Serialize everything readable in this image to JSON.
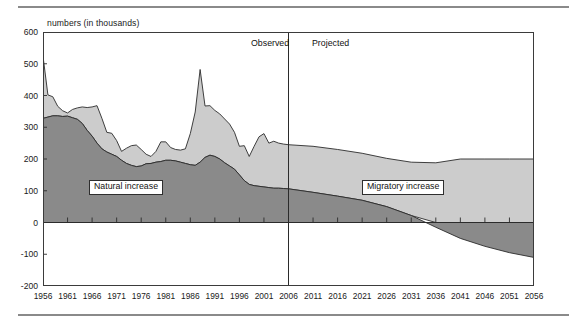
{
  "figure": {
    "y_axis_title": "numbers (in thousands)",
    "divider": {
      "observed_label": "Observed",
      "projected_label": "Projected",
      "divider_year": 2006
    },
    "series_labels": {
      "natural": "Natural increase",
      "migratory": "Migratory increase"
    },
    "colors": {
      "natural": "#8a8a8a",
      "migratory": "#cccccc",
      "axis": "#3b3b3b",
      "outline": "#2b2b2b",
      "rule": "#8a8a8a"
    }
  },
  "chart_data": {
    "type": "area",
    "title": "",
    "subtitle": "",
    "xlabel": "",
    "ylabel": "numbers (in thousands)",
    "stacked": true,
    "grid": false,
    "legend_position": "inline-annotation",
    "xlim": [
      1956,
      2056
    ],
    "ylim": [
      -200,
      600
    ],
    "ytick_labels": [
      "600",
      "500",
      "400",
      "300",
      "200",
      "100",
      "0",
      "-100",
      "-200"
    ],
    "yticks": [
      600,
      500,
      400,
      300,
      200,
      100,
      0,
      -100,
      -200
    ],
    "xtick_labels": [
      "1956",
      "1961",
      "1966",
      "1971",
      "1976",
      "1981",
      "1986",
      "1991",
      "1996",
      "2001",
      "2006",
      "2011",
      "2016",
      "2021",
      "2026",
      "2031",
      "2036",
      "2041",
      "2046",
      "2051",
      "2056"
    ],
    "xticks": [
      1956,
      1961,
      1966,
      1971,
      1976,
      1981,
      1986,
      1991,
      1996,
      2001,
      2006,
      2011,
      2016,
      2021,
      2026,
      2031,
      2036,
      2041,
      2046,
      2051,
      2056
    ],
    "annotations": [
      {
        "text": "Observed",
        "x": 2002,
        "note": "left of divider at 2006"
      },
      {
        "text": "Projected",
        "x": 2010,
        "note": "right of divider at 2006"
      }
    ],
    "x": [
      1956,
      1957,
      1958,
      1959,
      1960,
      1961,
      1962,
      1963,
      1964,
      1965,
      1966,
      1967,
      1968,
      1969,
      1970,
      1971,
      1972,
      1973,
      1974,
      1975,
      1976,
      1977,
      1978,
      1979,
      1980,
      1981,
      1982,
      1983,
      1984,
      1985,
      1986,
      1987,
      1988,
      1989,
      1990,
      1991,
      1992,
      1993,
      1994,
      1995,
      1996,
      1997,
      1998,
      1999,
      2000,
      2001,
      2002,
      2003,
      2004,
      2005,
      2006,
      2011,
      2016,
      2021,
      2026,
      2031,
      2036,
      2041,
      2046,
      2051,
      2056
    ],
    "series": [
      {
        "name": "Natural increase",
        "color": "#8a8a8a",
        "values": [
          328,
          332,
          336,
          336,
          334,
          335,
          330,
          325,
          312,
          290,
          272,
          250,
          232,
          222,
          215,
          208,
          196,
          186,
          180,
          176,
          178,
          185,
          186,
          190,
          192,
          196,
          196,
          194,
          190,
          186,
          182,
          180,
          190,
          205,
          212,
          208,
          200,
          188,
          178,
          168,
          150,
          132,
          120,
          116,
          114,
          112,
          110,
          108,
          108,
          107,
          106,
          95,
          83,
          70,
          50,
          22,
          -15,
          -50,
          -75,
          -95,
          -110
        ]
      },
      {
        "name": "Migratory increase",
        "color": "#cccccc",
        "values": [
          196,
          70,
          60,
          30,
          18,
          10,
          26,
          36,
          52,
          72,
          92,
          118,
          96,
          62,
          66,
          50,
          28,
          48,
          62,
          68,
          52,
          30,
          22,
          34,
          62,
          58,
          40,
          36,
          38,
          46,
          98,
          168,
          292,
          162,
          156,
          145,
          142,
          138,
          132,
          116,
          90,
          110,
          88,
          124,
          156,
          168,
          140,
          148,
          142,
          140,
          139,
          145,
          147,
          148,
          152,
          168,
          188,
          200,
          200,
          200,
          200
        ]
      }
    ],
    "totals": [
      524,
      402,
      396,
      366,
      352,
      345,
      356,
      361,
      364,
      362,
      364,
      368,
      328,
      284,
      281,
      258,
      224,
      234,
      242,
      244,
      230,
      215,
      208,
      224,
      254,
      254,
      236,
      230,
      228,
      232,
      280,
      348,
      482,
      367,
      368,
      353,
      342,
      326,
      310,
      284,
      240,
      242,
      208,
      240,
      270,
      280,
      250,
      256,
      250,
      247,
      245,
      240,
      230,
      218,
      202,
      190,
      173,
      150,
      125,
      105,
      90
    ]
  }
}
